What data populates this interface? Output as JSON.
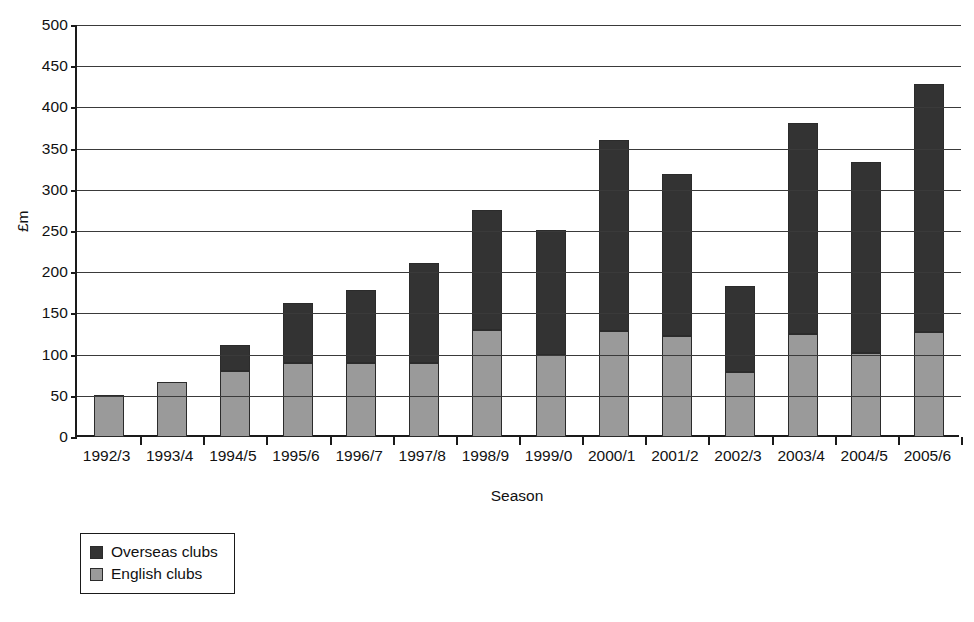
{
  "chart_data": {
    "type": "bar",
    "stacked": true,
    "title": "",
    "xlabel": "Season",
    "ylabel": "£m",
    "ylim": [
      0,
      500
    ],
    "ytick_step": 50,
    "yticks": [
      0,
      50,
      100,
      150,
      200,
      250,
      300,
      350,
      400,
      450,
      500
    ],
    "grid": true,
    "legend_position": "bottom-left",
    "categories": [
      "1992/3",
      "1993/4",
      "1994/5",
      "1995/6",
      "1996/7",
      "1997/8",
      "1998/9",
      "1999/0",
      "2000/1",
      "2001/2",
      "2002/3",
      "2003/4",
      "2004/5",
      "2005/6"
    ],
    "series": [
      {
        "name": "English clubs",
        "color": "#9a9a9a",
        "values": [
          51,
          67,
          80,
          90,
          90,
          90,
          130,
          99,
          129,
          123,
          79,
          125,
          102,
          127
        ]
      },
      {
        "name": "Overseas clubs",
        "color": "#333333",
        "values": [
          0,
          0,
          32,
          73,
          88,
          121,
          145,
          152,
          232,
          196,
          104,
          256,
          232,
          302
        ]
      }
    ],
    "totals": [
      51,
      67,
      112,
      163,
      178,
      211,
      275,
      251,
      361,
      319,
      183,
      381,
      334,
      429
    ],
    "stack_order": [
      "English clubs",
      "Overseas clubs"
    ]
  },
  "legend": {
    "items": [
      {
        "label": "Overseas clubs",
        "swatch": "#333333",
        "swatch_name": "legend-swatch-overseas"
      },
      {
        "label": "English clubs",
        "swatch": "#9a9a9a",
        "swatch_name": "legend-swatch-english"
      }
    ]
  },
  "axes": {
    "y_title": "£m",
    "x_title": "Season"
  }
}
